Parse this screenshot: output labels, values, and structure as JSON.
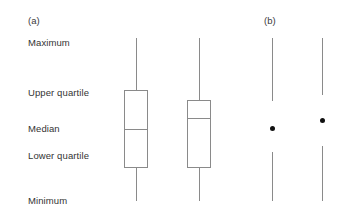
{
  "figure": {
    "width": 347,
    "height": 217,
    "background": "#ffffff",
    "line_color": "#8a8a8a",
    "dot_color": "#111111",
    "text_color": "#333333"
  },
  "panels": [
    {
      "id": "panel-a",
      "label": "(a)",
      "x": 28,
      "y": 15
    },
    {
      "id": "panel-b",
      "label": "(b)",
      "x": 264,
      "y": 15
    }
  ],
  "axis_labels": [
    {
      "id": "maximum",
      "text": "Maximum",
      "x": 28,
      "y": 37
    },
    {
      "id": "upper-quartile",
      "text": "Upper quartile",
      "x": 28,
      "y": 87
    },
    {
      "id": "median",
      "text": "Median",
      "x": 28,
      "y": 123
    },
    {
      "id": "lower-quartile",
      "text": "Lower quartile",
      "x": 28,
      "y": 150
    },
    {
      "id": "minimum",
      "text": "Minimum",
      "x": 28,
      "y": 195
    }
  ],
  "chart_data": {
    "type": "box",
    "title": "",
    "xlabel": "",
    "ylabel": "",
    "annotations": [
      "Maximum",
      "Upper quartile",
      "Median",
      "Lower quartile",
      "Minimum"
    ],
    "series": [
      {
        "name": "boxplot-1",
        "panel": "(a)",
        "center_x": 136,
        "box_left": 124,
        "box_right": 148,
        "maximum_y": 38,
        "upper_quartile_y": 90,
        "median_y": 129,
        "lower_quartile_y": 168,
        "minimum_y": 201
      },
      {
        "name": "boxplot-2",
        "panel": "(a)",
        "center_x": 199,
        "box_left": 187,
        "box_right": 211,
        "maximum_y": 38,
        "upper_quartile_y": 100,
        "median_y": 118,
        "lower_quartile_y": 168,
        "minimum_y": 201
      },
      {
        "name": "interval-1",
        "panel": "(b)",
        "center_x": 272,
        "upper_segment_top_y": 38,
        "upper_segment_bottom_y": 101,
        "point_y": 128,
        "lower_segment_top_y": 152,
        "lower_segment_bottom_y": 201
      },
      {
        "name": "interval-2",
        "panel": "(b)",
        "center_x": 322,
        "upper_segment_top_y": 38,
        "upper_segment_bottom_y": 95,
        "point_y": 120,
        "lower_segment_top_y": 146,
        "lower_segment_bottom_y": 201
      }
    ]
  }
}
